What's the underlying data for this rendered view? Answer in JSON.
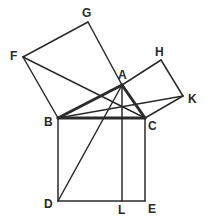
{
  "colors": {
    "line": "#2b2b2b",
    "background": "#ffffff"
  },
  "points": {
    "A": {
      "x": 122,
      "y": 85,
      "lx": 118,
      "ly": 79
    },
    "B": {
      "x": 58,
      "y": 118,
      "lx": 44,
      "ly": 126
    },
    "C": {
      "x": 145,
      "y": 118,
      "lx": 148,
      "ly": 130
    },
    "D": {
      "x": 58,
      "y": 201,
      "lx": 44,
      "ly": 208
    },
    "E": {
      "x": 145,
      "y": 201,
      "lx": 148,
      "ly": 213
    },
    "L": {
      "x": 122,
      "y": 201,
      "lx": 118,
      "ly": 214
    },
    "F": {
      "x": 23,
      "y": 57,
      "lx": 10,
      "ly": 60
    },
    "G": {
      "x": 88,
      "y": 22,
      "lx": 82,
      "ly": 17
    },
    "H": {
      "x": 161,
      "y": 60,
      "lx": 155,
      "ly": 56
    },
    "K": {
      "x": 183,
      "y": 96,
      "lx": 188,
      "ly": 103
    }
  },
  "labels": [
    "A",
    "B",
    "C",
    "D",
    "E",
    "F",
    "G",
    "H",
    "K",
    "L"
  ],
  "segments": [
    {
      "name": "triangle-side-ab",
      "from": "A",
      "to": "B",
      "width": 3
    },
    {
      "name": "triangle-side-ac",
      "from": "A",
      "to": "C",
      "width": 3
    },
    {
      "name": "triangle-side-bc",
      "from": "B",
      "to": "C",
      "width": 3
    },
    {
      "name": "square-ab-side-bf",
      "from": "B",
      "to": "F",
      "width": 1.5
    },
    {
      "name": "square-ab-side-fg",
      "from": "F",
      "to": "G",
      "width": 1.5
    },
    {
      "name": "square-ab-side-ga",
      "from": "G",
      "to": "A",
      "width": 1.5
    },
    {
      "name": "square-ac-side-ah",
      "from": "A",
      "to": "H",
      "width": 1.5
    },
    {
      "name": "square-ac-side-hk",
      "from": "H",
      "to": "K",
      "width": 1.5
    },
    {
      "name": "square-ac-side-kc",
      "from": "K",
      "to": "C",
      "width": 1.5
    },
    {
      "name": "square-bc-side-bd",
      "from": "B",
      "to": "D",
      "width": 1.5
    },
    {
      "name": "square-bc-side-de",
      "from": "D",
      "to": "E",
      "width": 1.5
    },
    {
      "name": "square-bc-side-ec",
      "from": "E",
      "to": "C",
      "width": 1.5
    },
    {
      "name": "line-al",
      "from": "A",
      "to": "L",
      "width": 1.5
    },
    {
      "name": "line-ad",
      "from": "A",
      "to": "D",
      "width": 1.5
    },
    {
      "name": "line-fc",
      "from": "F",
      "to": "C",
      "width": 1.5
    },
    {
      "name": "line-bk",
      "from": "B",
      "to": "K",
      "width": 1.5
    }
  ]
}
